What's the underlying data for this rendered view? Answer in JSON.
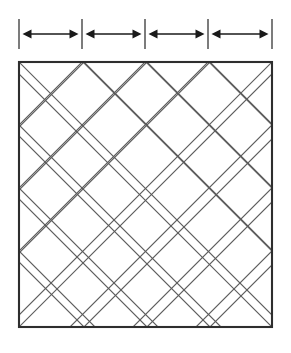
{
  "figure": {
    "canvas": {
      "width": 291,
      "height": 353,
      "background": "#ffffff"
    },
    "colors": {
      "square_border": "#2e2e2e",
      "lattice_line": "#5b5b5b",
      "dimension_arrow": "#1a1a1a",
      "dimension_tick": "#6e6e6e"
    }
  },
  "dimension_bar": {
    "label": "dimension bar",
    "tick_count": 5,
    "segment_count": 4,
    "tick_positions_x": [
      19,
      82,
      145,
      208,
      272
    ],
    "tick_top_y": 19,
    "tick_bottom_y": 49,
    "arrow_y": 34,
    "segments": [
      {
        "name": "segment-1",
        "start_x": 19,
        "end_x": 82
      },
      {
        "name": "segment-2",
        "start_x": 82,
        "end_x": 145
      },
      {
        "name": "segment-3",
        "start_x": 145,
        "end_x": 208
      },
      {
        "name": "segment-4",
        "start_x": 208,
        "end_x": 272
      }
    ]
  },
  "square": {
    "label": "outer square",
    "left": 19,
    "top": 62,
    "right": 272,
    "bottom": 327,
    "divisions": 4
  },
  "lattice": {
    "label": "45 degree diagonal lattice",
    "angle_degrees": 45,
    "edge_vertices_top_x": [
      84,
      147,
      210
    ],
    "edge_vertices_bottom_x": [
      84,
      147,
      210
    ],
    "edge_vertices_left_y": [
      125,
      188,
      251
    ],
    "edge_vertices_right_y": [
      125,
      188,
      251
    ],
    "description": "Two families of parallel 45-degree lines crossing to form diamonds"
  }
}
